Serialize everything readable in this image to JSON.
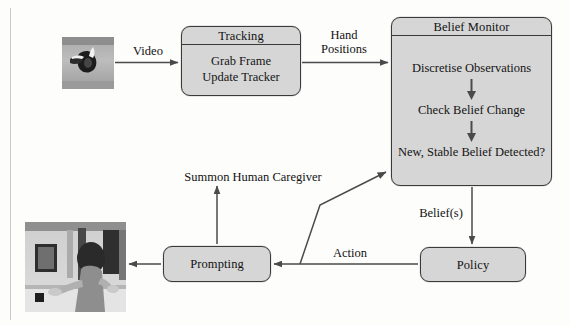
{
  "figure": {
    "type": "system-flow-diagram"
  },
  "nodes": {
    "tracking": {
      "title": "Tracking",
      "steps": [
        "Grab Frame",
        "Update Tracker"
      ]
    },
    "belief_monitor": {
      "title": "Belief Monitor",
      "steps": [
        "Discretise\nObservations",
        "Check Belief Change",
        "New, Stable Belief Detected?"
      ]
    },
    "policy": {
      "title": "Policy"
    },
    "prompting": {
      "title": "Prompting"
    }
  },
  "photos": {
    "hand_tracking": {
      "caption": "hand-tracking-frame"
    },
    "person_at_sink": {
      "caption": "person-at-sink-frame"
    }
  },
  "edges": {
    "video": "Video",
    "hand_positions": "Hand\nPositions",
    "beliefs": "Belief(s)",
    "action": "Action",
    "summon": "Summon Human Caregiver"
  },
  "colors": {
    "node_fill": "#d6d6d6",
    "node_border": "#3a3a3a",
    "connector": "#4a4a4a",
    "text": "#121212",
    "page": "#fdfdfc"
  }
}
